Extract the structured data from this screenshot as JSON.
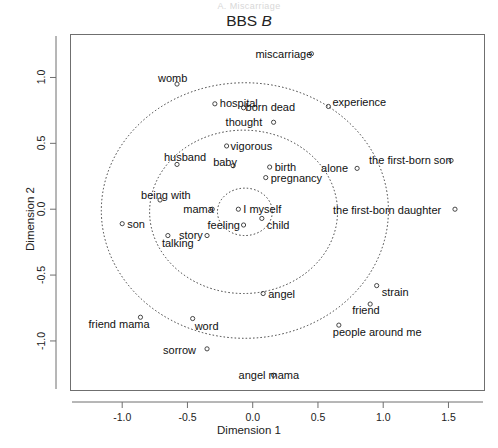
{
  "ghost_header": "A. Miscarriage",
  "chart_data": {
    "type": "scatter",
    "title_main": "BBS",
    "title_italic": "B",
    "title": "BBS B",
    "xlabel": "Dimension 1",
    "ylabel": "Dimension 2",
    "xlim": [
      -1.4,
      1.78
    ],
    "ylim": [
      -1.38,
      1.33
    ],
    "xticks": [
      -1.0,
      -0.5,
      0.0,
      0.5,
      1.0,
      1.5
    ],
    "xticklabels": [
      "-1.0",
      "-0.5",
      "0.0",
      "0.5",
      "1.0",
      "1.5"
    ],
    "yticks": [
      -1.0,
      -0.5,
      0.0,
      0.5,
      1.0
    ],
    "yticklabels": [
      "-1.0",
      "-0.5",
      "0.0",
      "0.5",
      "1.0"
    ],
    "grid": false,
    "legend": "none",
    "marker": "open-circle",
    "rings": [
      {
        "name": "inner-ring",
        "cx": -0.06,
        "cy": -0.02,
        "rx": 0.21,
        "ry": 0.18
      },
      {
        "name": "middle-ring",
        "cx": -0.07,
        "cy": -0.02,
        "rx": 0.72,
        "ry": 0.62
      },
      {
        "name": "outer-ring",
        "cx": -0.06,
        "cy": -0.01,
        "rx": 1.1,
        "ry": 0.97
      }
    ],
    "points": [
      {
        "label": "miscarriage",
        "x": 0.45,
        "y": 1.18,
        "lx": -56,
        "ly": -5
      },
      {
        "label": "womb",
        "x": -0.58,
        "y": 0.95,
        "lx": -19,
        "ly": -11
      },
      {
        "label": "hospital",
        "x": -0.29,
        "y": 0.8,
        "lx": 5,
        "ly": -6
      },
      {
        "label": "born dead",
        "x": -0.07,
        "y": 0.77,
        "lx": 2,
        "ly": -6
      },
      {
        "label": "experience",
        "x": 0.58,
        "y": 0.78,
        "lx": 4,
        "ly": -9
      },
      {
        "label": "thought",
        "x": 0.16,
        "y": 0.66,
        "lx": -48,
        "ly": -5
      },
      {
        "label": "vigorous",
        "x": -0.2,
        "y": 0.48,
        "lx": 4,
        "ly": -5
      },
      {
        "label": "husband",
        "x": -0.58,
        "y": 0.34,
        "lx": -13,
        "ly": -12
      },
      {
        "label": "baby",
        "x": -0.15,
        "y": 0.33,
        "lx": -20,
        "ly": -9
      },
      {
        "label": "birth",
        "x": 0.13,
        "y": 0.32,
        "lx": 5,
        "ly": -5
      },
      {
        "label": "pregnancy",
        "x": 0.1,
        "y": 0.24,
        "lx": 5,
        "ly": -5
      },
      {
        "label": "alone",
        "x": 0.8,
        "y": 0.31,
        "lx": -36,
        "ly": -5
      },
      {
        "label": "the first-born son",
        "x": 1.52,
        "y": 0.37,
        "lx": -82,
        "ly": -5
      },
      {
        "label": "being with",
        "x": -0.71,
        "y": 0.07,
        "lx": -19,
        "ly": -10
      },
      {
        "label": "mama",
        "x": -0.31,
        "y": 0.0,
        "lx": -29,
        "ly": -5
      },
      {
        "label": "I myself",
        "x": -0.11,
        "y": 0.0,
        "lx": 5,
        "ly": -5
      },
      {
        "label": "the first-born daughter",
        "x": 1.55,
        "y": 0.0,
        "lx": -122,
        "ly": -4
      },
      {
        "label": "son",
        "x": -1.0,
        "y": -0.11,
        "lx": 5,
        "ly": -5
      },
      {
        "label": "feeling",
        "x": -0.07,
        "y": -0.12,
        "lx": -36,
        "ly": -5
      },
      {
        "label": "child",
        "x": 0.07,
        "y": -0.07,
        "lx": 5,
        "ly": 2
      },
      {
        "label": "story",
        "x": -0.35,
        "y": -0.2,
        "lx": -28,
        "ly": -6
      },
      {
        "label": "talking",
        "x": -0.65,
        "y": -0.2,
        "lx": -6,
        "ly": 2
      },
      {
        "label": "angel",
        "x": 0.08,
        "y": -0.64,
        "lx": 5,
        "ly": -5
      },
      {
        "label": "strain",
        "x": 0.95,
        "y": -0.58,
        "lx": 5,
        "ly": 1
      },
      {
        "label": "friend",
        "x": 0.9,
        "y": -0.72,
        "lx": -18,
        "ly": 1
      },
      {
        "label": "friend mama",
        "x": -0.86,
        "y": -0.82,
        "lx": -52,
        "ly": 2
      },
      {
        "label": "word",
        "x": -0.46,
        "y": -0.83,
        "lx": 2,
        "ly": 2
      },
      {
        "label": "people around me",
        "x": 0.66,
        "y": -0.88,
        "lx": -6,
        "ly": 2
      },
      {
        "label": "sorrow",
        "x": -0.35,
        "y": -1.06,
        "lx": -44,
        "ly": -4
      },
      {
        "label": "angel mama",
        "x": 0.16,
        "y": -1.26,
        "lx": -35,
        "ly": -5
      }
    ]
  }
}
